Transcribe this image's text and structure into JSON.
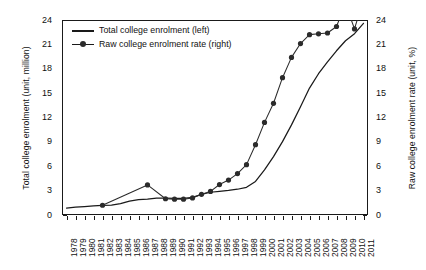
{
  "chart_data": {
    "type": "line",
    "title": "",
    "xlabel": "",
    "grid": false,
    "legend_position": "top-left-inside",
    "x": [
      1978,
      1979,
      1980,
      1981,
      1982,
      1983,
      1984,
      1985,
      1986,
      1987,
      1988,
      1989,
      1990,
      1991,
      1992,
      1993,
      1994,
      1995,
      1996,
      1997,
      1998,
      1999,
      2000,
      2001,
      2002,
      2003,
      2004,
      2005,
      2006,
      2007,
      2008,
      2009,
      2010,
      2011
    ],
    "xtick_labels": [
      "1978",
      "1979",
      "1980",
      "1981",
      "1982",
      "1983",
      "1984",
      "1985",
      "1986",
      "1987",
      "1988",
      "1989",
      "1990",
      "1991",
      "1992",
      "1993",
      "1994",
      "1995",
      "1996",
      "1997",
      "1998",
      "1999",
      "2000",
      "2001",
      "2002",
      "2003",
      "2004",
      "2005",
      "2006",
      "2007",
      "2008",
      "2009",
      "2010",
      "2011"
    ],
    "axes": {
      "left": {
        "label": "Total college enrolment (unit, million)",
        "unit": "million",
        "lim": [
          0,
          24
        ],
        "ticks": [
          0,
          3,
          6,
          9,
          12,
          15,
          18,
          21,
          24
        ],
        "tick_labels": [
          "0",
          "3",
          "6",
          "9",
          "12",
          "15",
          "18",
          "21",
          "24"
        ]
      },
      "right": {
        "label": "Raw college enrolment rate (unit, %)",
        "unit": "%",
        "lim": [
          0,
          24
        ],
        "ticks": [
          0,
          3,
          6,
          9,
          12,
          15,
          18,
          21,
          24
        ],
        "tick_labels": [
          "0",
          "3",
          "6",
          "9",
          "12",
          "15",
          "18",
          "21",
          "24"
        ]
      }
    },
    "series": [
      {
        "name": "Total college enrolment (left)",
        "axis": "left",
        "style": "line",
        "marker": "none",
        "color": "#1a1a1a",
        "values": [
          0.86,
          0.96,
          1.04,
          1.13,
          1.17,
          1.21,
          1.4,
          1.7,
          1.88,
          1.96,
          2.07,
          2.08,
          2.06,
          2.04,
          2.18,
          2.54,
          2.8,
          2.91,
          3.02,
          3.17,
          3.41,
          4.13,
          5.56,
          7.19,
          9.03,
          11.09,
          13.33,
          15.62,
          17.39,
          18.85,
          20.21,
          21.45,
          22.32,
          23.59
        ]
      },
      {
        "name": "Raw college enrolment rate (right)",
        "axis": "right",
        "style": "line",
        "marker": "circle",
        "color": "#2b2b2b",
        "values": [
          null,
          null,
          null,
          null,
          1.2,
          null,
          null,
          null,
          null,
          3.7,
          null,
          2.0,
          1.95,
          1.95,
          2.1,
          2.55,
          2.9,
          3.75,
          4.3,
          5.1,
          6.2,
          8.65,
          11.4,
          13.75,
          16.9,
          19.4,
          21.1,
          22.2,
          22.3,
          22.4,
          23.2,
          26.0,
          22.9,
          26.6
        ]
      }
    ]
  },
  "legend": {
    "items": [
      {
        "label": "Total college enrolment (left)",
        "marker": "line"
      },
      {
        "label": "Raw college enrolment rate (right)",
        "marker": "line-dot"
      }
    ]
  }
}
